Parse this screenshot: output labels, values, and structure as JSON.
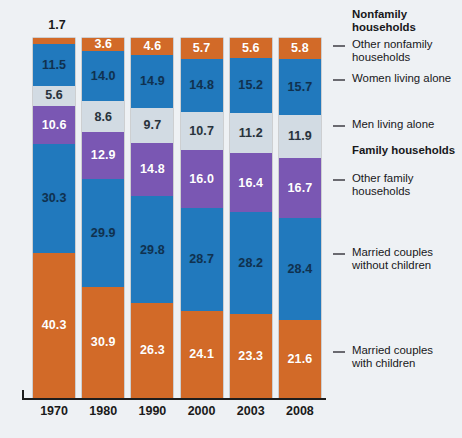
{
  "chart_data": {
    "type": "bar",
    "subtype": "stacked-percentage",
    "title": "",
    "xlabel": "",
    "ylabel": "",
    "ylim": [
      0,
      100
    ],
    "grid": false,
    "legend_position": "right",
    "categories": [
      "1970",
      "1980",
      "1990",
      "2000",
      "2003",
      "2008"
    ],
    "stack_order_top_to_bottom": [
      "Other nonfamily households",
      "Women living alone",
      "Men living alone",
      "Other family households",
      "Married couples without children",
      "Married couples with children"
    ],
    "series": [
      {
        "name": "Other nonfamily households",
        "color": "#d26a28",
        "values": [
          1.7,
          3.6,
          4.6,
          5.7,
          5.6,
          5.8
        ]
      },
      {
        "name": "Women living alone",
        "color": "#2179bd",
        "values": [
          11.5,
          14.0,
          14.9,
          14.8,
          15.2,
          15.7
        ]
      },
      {
        "name": "Men living alone",
        "color": "#d2dbe3",
        "values": [
          5.6,
          8.6,
          9.7,
          10.7,
          11.2,
          11.9
        ]
      },
      {
        "name": "Other family households",
        "color": "#7a57b3",
        "values": [
          10.6,
          12.9,
          14.8,
          16.0,
          16.4,
          16.7
        ]
      },
      {
        "name": "Married couples without children",
        "color": "#2179bd",
        "values": [
          30.3,
          29.9,
          29.8,
          28.7,
          28.2,
          28.4
        ]
      },
      {
        "name": "Married couples with children",
        "color": "#d26a28",
        "values": [
          40.3,
          30.9,
          26.3,
          24.1,
          23.3,
          21.6
        ]
      }
    ],
    "group_headings": [
      "Nonfamily households",
      "Family households"
    ],
    "external_value_labels": {
      "1970_other_nonfamily": "1.7"
    }
  },
  "axis": {
    "ticks": [
      {
        "label": "1970"
      },
      {
        "label": "1980"
      },
      {
        "label": "1990"
      },
      {
        "label": "2000"
      },
      {
        "label": "2003"
      },
      {
        "label": "2008"
      }
    ]
  },
  "legend": {
    "items": [
      {
        "id": "nonfamily-households",
        "line1": "Nonfamily",
        "line2": "households",
        "bold": true,
        "dash": false
      },
      {
        "id": "other-nonfamily-households",
        "line1": "Other nonfamily",
        "line2": "households",
        "bold": false,
        "dash": true
      },
      {
        "id": "women-living-alone",
        "line1": "Women living alone",
        "line2": "",
        "bold": false,
        "dash": true
      },
      {
        "id": "men-living-alone",
        "line1": "Men living alone",
        "line2": "",
        "bold": false,
        "dash": true
      },
      {
        "id": "family-households",
        "line1": "Family households",
        "line2": "",
        "bold": true,
        "dash": false
      },
      {
        "id": "other-family-households",
        "line1": "Other family",
        "line2": "households",
        "bold": false,
        "dash": true
      },
      {
        "id": "married-couples-without-children",
        "line1": "Married couples",
        "line2": "without children",
        "bold": false,
        "dash": true
      },
      {
        "id": "married-couples-with-children",
        "line1": "Married couples",
        "line2": "with children",
        "bold": false,
        "dash": true
      }
    ]
  },
  "colors": {
    "orange": "#d26a28",
    "blue": "#2179bd",
    "gray": "#d2dbe3",
    "purple": "#7a57b3",
    "background": "#eef1f4",
    "axis": "#1d1d1d"
  }
}
